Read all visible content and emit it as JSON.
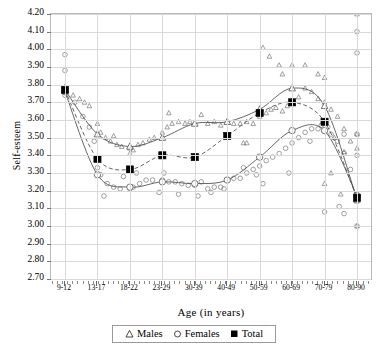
{
  "chart_data": {
    "type": "scatter",
    "title": "",
    "xlabel": "Age  (in years)",
    "ylabel": "Self-esteem",
    "categories": [
      "9-12",
      "13-17",
      "18-22",
      "23-29",
      "30-39",
      "40-49",
      "50-59",
      "60-69",
      "70-79",
      "80-90"
    ],
    "ylim": [
      2.7,
      4.2
    ],
    "ytick_step": 0.1,
    "yticks": [
      "4.20",
      "4.10",
      "4.00",
      "3.90",
      "3.80",
      "3.70",
      "3.60",
      "3.50",
      "3.40",
      "3.30",
      "3.20",
      "3.10",
      "3.00",
      "2.90",
      "2.80",
      "2.70"
    ],
    "grid": true,
    "legend_position": "bottom",
    "series": [
      {
        "name": "Males",
        "marker": "open-triangle",
        "values": [
          3.77,
          3.52,
          3.45,
          3.5,
          3.58,
          3.59,
          3.66,
          3.78,
          3.68,
          3.15
        ]
      },
      {
        "name": "Females",
        "marker": "open-circle",
        "values": [
          3.76,
          3.29,
          3.22,
          3.25,
          3.24,
          3.26,
          3.39,
          3.54,
          3.54,
          3.17
        ]
      },
      {
        "name": "Total",
        "marker": "filled-square",
        "values": [
          3.77,
          3.38,
          3.32,
          3.4,
          3.39,
          3.51,
          3.64,
          3.7,
          3.59,
          3.16
        ]
      }
    ],
    "males_points": [
      [
        0,
        3.79
      ],
      [
        0,
        3.77
      ],
      [
        0.25,
        3.74
      ],
      [
        0.45,
        3.72
      ],
      [
        0.6,
        3.7
      ],
      [
        0.75,
        3.68
      ],
      [
        1,
        3.58
      ],
      [
        1.1,
        3.53
      ],
      [
        1.25,
        3.5
      ],
      [
        1.4,
        3.48
      ],
      [
        1.6,
        3.46
      ],
      [
        1.75,
        3.45
      ],
      [
        2,
        3.44
      ],
      [
        2.1,
        3.43
      ],
      [
        2.25,
        3.46
      ],
      [
        2.4,
        3.47
      ],
      [
        2.6,
        3.49
      ],
      [
        2.75,
        3.5
      ],
      [
        3,
        3.53
      ],
      [
        3.15,
        3.56
      ],
      [
        3.3,
        3.58
      ],
      [
        3.5,
        3.59
      ],
      [
        3.7,
        3.58
      ],
      [
        3.85,
        3.59
      ],
      [
        4,
        3.58
      ],
      [
        4.2,
        3.63
      ],
      [
        4.4,
        3.58
      ],
      [
        4.6,
        3.59
      ],
      [
        4.8,
        3.57
      ],
      [
        5,
        3.59
      ],
      [
        5.2,
        3.58
      ],
      [
        5.4,
        3.58
      ],
      [
        5.6,
        3.59
      ],
      [
        5.8,
        3.58
      ],
      [
        6,
        3.62
      ],
      [
        6.2,
        3.64
      ],
      [
        6.35,
        3.66
      ],
      [
        6.5,
        3.67
      ],
      [
        6.7,
        3.65
      ],
      [
        6.85,
        3.68
      ],
      [
        7,
        3.71
      ],
      [
        7.2,
        3.73
      ],
      [
        7.4,
        3.78
      ],
      [
        7.6,
        3.76
      ],
      [
        7.8,
        3.72
      ],
      [
        8,
        3.7
      ],
      [
        8.2,
        3.66
      ],
      [
        8.4,
        3.62
      ],
      [
        8.6,
        3.55
      ],
      [
        8.8,
        3.48
      ],
      [
        9,
        3.14
      ],
      [
        9,
        4.2
      ],
      [
        9,
        3.52
      ],
      [
        9,
        3.44
      ],
      [
        8.6,
        3.42
      ],
      [
        8.3,
        3.5
      ],
      [
        3.2,
        3.64
      ],
      [
        2.0,
        3.41
      ],
      [
        1.5,
        3.51
      ],
      [
        5.5,
        3.47
      ],
      [
        5.6,
        3.47
      ],
      [
        6.1,
        4.01
      ],
      [
        6.3,
        3.96
      ],
      [
        6.6,
        3.91
      ],
      [
        7.0,
        3.91
      ],
      [
        7.4,
        3.91
      ],
      [
        6.7,
        3.86
      ],
      [
        7.8,
        3.86
      ],
      [
        8.0,
        3.84
      ],
      [
        8.2,
        3.3
      ],
      [
        8.0,
        3.24
      ],
      [
        8.5,
        3.18
      ],
      [
        9,
        3.0
      ]
    ],
    "females_points": [
      [
        0,
        3.97
      ],
      [
        0,
        3.88
      ],
      [
        0,
        3.76
      ],
      [
        0,
        3.74
      ],
      [
        0.3,
        3.7
      ],
      [
        0.55,
        3.62
      ],
      [
        0.75,
        3.56
      ],
      [
        0.9,
        3.48
      ],
      [
        1,
        3.33
      ],
      [
        1.1,
        3.29
      ],
      [
        1.3,
        3.24
      ],
      [
        1.5,
        3.22
      ],
      [
        1.7,
        3.21
      ],
      [
        2,
        3.21
      ],
      [
        2.1,
        3.22
      ],
      [
        2.3,
        3.24
      ],
      [
        2.5,
        3.26
      ],
      [
        2.7,
        3.26
      ],
      [
        3,
        3.26
      ],
      [
        3.2,
        3.25
      ],
      [
        3.4,
        3.25
      ],
      [
        3.6,
        3.24
      ],
      [
        3.8,
        3.23
      ],
      [
        4,
        3.23
      ],
      [
        4.2,
        3.25
      ],
      [
        4.4,
        3.21
      ],
      [
        4.6,
        3.22
      ],
      [
        4.8,
        3.22
      ],
      [
        5,
        3.26
      ],
      [
        5.2,
        3.27
      ],
      [
        5.4,
        3.27
      ],
      [
        5.6,
        3.3
      ],
      [
        5.8,
        3.32
      ],
      [
        6,
        3.34
      ],
      [
        6.2,
        3.37
      ],
      [
        6.4,
        3.39
      ],
      [
        6.6,
        3.41
      ],
      [
        6.8,
        3.44
      ],
      [
        7,
        3.47
      ],
      [
        7.2,
        3.5
      ],
      [
        7.4,
        3.53
      ],
      [
        7.6,
        3.55
      ],
      [
        7.8,
        3.55
      ],
      [
        8,
        3.54
      ],
      [
        8.2,
        3.52
      ],
      [
        8.4,
        3.48
      ],
      [
        8.6,
        3.41
      ],
      [
        8.8,
        3.32
      ],
      [
        9,
        3.18
      ],
      [
        9,
        4.1
      ],
      [
        9,
        3.98
      ],
      [
        9,
        3.52
      ],
      [
        8.6,
        3.52
      ],
      [
        9,
        3.4
      ],
      [
        9,
        3.0
      ],
      [
        1.2,
        3.17
      ],
      [
        2.9,
        3.19
      ],
      [
        3.5,
        3.18
      ],
      [
        4.1,
        3.17
      ],
      [
        4.5,
        3.19
      ],
      [
        5.5,
        3.33
      ],
      [
        5.9,
        3.29
      ],
      [
        6.9,
        3.3
      ],
      [
        7.9,
        3.57
      ],
      [
        8.1,
        3.56
      ],
      [
        1.8,
        3.28
      ],
      [
        2.2,
        3.3
      ],
      [
        3.05,
        3.3
      ],
      [
        4.9,
        3.21
      ],
      [
        6.1,
        3.24
      ],
      [
        7.55,
        3.48
      ],
      [
        8.45,
        3.11
      ],
      [
        8.0,
        3.08
      ],
      [
        8.6,
        3.07
      ]
    ]
  },
  "legend": {
    "items": [
      {
        "label": "Males",
        "marker": "open-triangle"
      },
      {
        "label": "Females",
        "marker": "open-circle"
      },
      {
        "label": "Total",
        "marker": "filled-square"
      }
    ]
  },
  "colors": {
    "line": "#555555",
    "grid": "#d9d9d9",
    "frame": "#b9b9b9",
    "marker_open": "#777777",
    "marker_fill": "#000000"
  }
}
